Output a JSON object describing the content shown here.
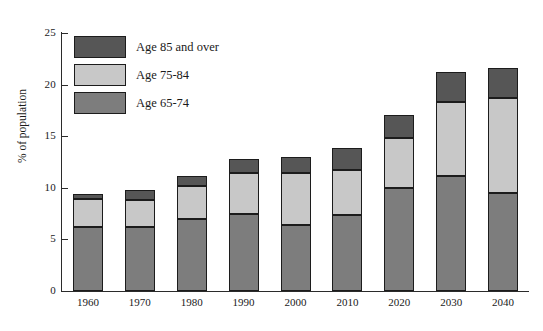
{
  "chart_data": {
    "type": "bar",
    "subtype": "stacked-vertical",
    "title": "",
    "xlabel": "",
    "ylabel": "% of population",
    "ylim": [
      0,
      25
    ],
    "yticks": [
      0,
      5,
      10,
      15,
      20,
      25
    ],
    "ytick_labels": [
      "0",
      "5",
      "10",
      "15",
      "20",
      "25"
    ],
    "grid": false,
    "legend_position": "upper-left-inside",
    "categories": [
      "1960",
      "1970",
      "1980",
      "1990",
      "2000",
      "2010",
      "2020",
      "2030",
      "2040"
    ],
    "series": [
      {
        "name": "Age 65-74",
        "color": "#7d7d7d",
        "values": [
          6.2,
          6.2,
          7.0,
          7.5,
          6.4,
          7.4,
          10.0,
          11.1,
          9.5
        ]
      },
      {
        "name": "Age 75-84",
        "color": "#c8c8c8",
        "values": [
          2.7,
          2.6,
          3.2,
          3.9,
          5.0,
          4.3,
          4.8,
          7.2,
          9.2
        ]
      },
      {
        "name": "Age 85 and over",
        "color": "#565656",
        "values": [
          0.5,
          1.0,
          0.9,
          1.4,
          1.6,
          2.2,
          2.3,
          2.9,
          2.9
        ]
      }
    ],
    "totals": [
      9.4,
      9.8,
      11.1,
      12.8,
      13.0,
      13.9,
      17.2,
      21.2,
      21.6
    ],
    "stack_order_bottom_to_top": [
      "Age 65-74",
      "Age 75-84",
      "Age 85 and over"
    ]
  },
  "legend": {
    "items": [
      {
        "label": "Age 85 and over",
        "color": "#565656"
      },
      {
        "label": "Age 75-84",
        "color": "#c8c8c8"
      },
      {
        "label": "Age 65-74",
        "color": "#7d7d7d"
      }
    ]
  },
  "axes": {
    "y_title": "% of population",
    "y_labels": [
      "25",
      "20",
      "15",
      "10",
      "5",
      "0"
    ],
    "x_labels": [
      "1960",
      "1970",
      "1980",
      "1990",
      "2000",
      "2010",
      "2020",
      "2030",
      "2040"
    ]
  },
  "colors": {
    "age_85_over": "#565656",
    "age_75_84": "#c8c8c8",
    "age_65_74": "#7d7d7d",
    "axis": "#2b2b2b",
    "outline": "#1c1c1c",
    "background": "#ffffff"
  }
}
